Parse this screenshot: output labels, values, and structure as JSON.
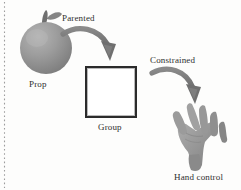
{
  "figure": {
    "background_color": "#fdfdfc"
  },
  "nodes": [
    {
      "id": "prop",
      "label": "Prop",
      "icon": "apple-prop-icon",
      "shape": "sphere-with-stem-and-leaf",
      "color": "#8f8f8f",
      "x": 48,
      "y": 48
    },
    {
      "id": "group",
      "label": "Group",
      "icon": "square-group-icon",
      "shape": "square",
      "color": "#2b2b2b",
      "x": 111,
      "y": 92
    },
    {
      "id": "hand_control",
      "label": "Hand control",
      "icon": "hand-control-icon",
      "shape": "open-hand",
      "color": "#8f8f8f",
      "x": 198,
      "y": 140
    }
  ],
  "connections": [
    {
      "id": "parented",
      "label": "Parented",
      "from": "prop",
      "to": "group",
      "style": "curved-arrow",
      "color": "#7c7c7c"
    },
    {
      "id": "constrained",
      "label": "Constrained",
      "from": "group",
      "to": "hand_control",
      "style": "curved-arrow",
      "color": "#7c7c7c"
    }
  ],
  "margin_rule": {
    "name": "page-margin-perforation",
    "color": "#9a9a9a",
    "style": "dotted"
  },
  "colors": {
    "prop_body_light": "#a9a9a9",
    "prop_body_dark": "#808080",
    "prop_stem": "#6e6e6e",
    "arrow": "#7c7c7c",
    "arrow_dark": "#6a6a6a",
    "hand_light": "#a3a3a3",
    "hand_mid": "#8d8d8d",
    "hand_dark": "#767676",
    "square_border": "#2b2b2b",
    "text": "#2f2f2f"
  }
}
